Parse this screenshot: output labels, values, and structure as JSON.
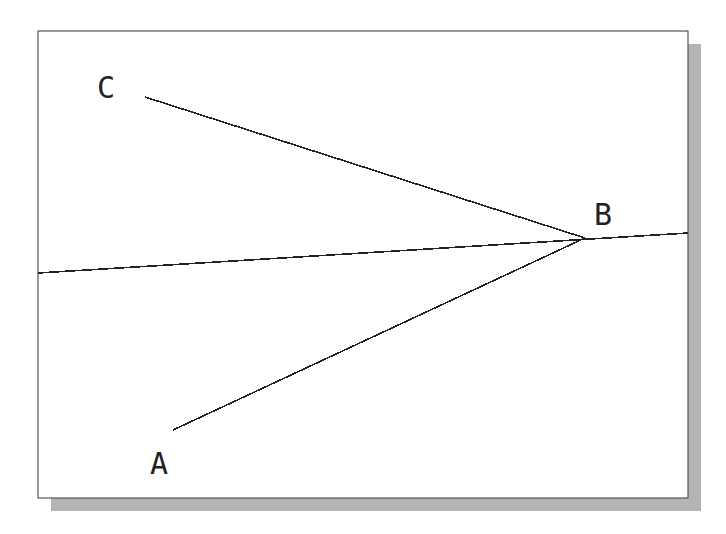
{
  "diagram": {
    "frame": {
      "x": 38,
      "y": 31,
      "width": 650,
      "height": 467,
      "shadow_offset": 13,
      "border_color": "#555555",
      "shadow_color": "#b4b4b4",
      "fill": "#ffffff"
    },
    "line_color": "#222222",
    "points": {
      "A": {
        "label": "A",
        "x": 173,
        "y": 430,
        "label_x": 150,
        "label_y": 474
      },
      "B": {
        "label": "B",
        "x": 585,
        "y": 238,
        "label_x": 594,
        "label_y": 225
      },
      "C": {
        "label": "C",
        "x": 145,
        "y": 97,
        "label_x": 97,
        "label_y": 98
      }
    },
    "segments": [
      {
        "name": "segment-CB",
        "from": [
          145,
          97
        ],
        "to": [
          585,
          238
        ]
      },
      {
        "name": "segment-AB",
        "from": [
          173,
          430
        ],
        "to": [
          585,
          238
        ]
      },
      {
        "name": "line-through-B",
        "from": [
          38,
          273
        ],
        "to": [
          688,
          233
        ]
      }
    ]
  }
}
